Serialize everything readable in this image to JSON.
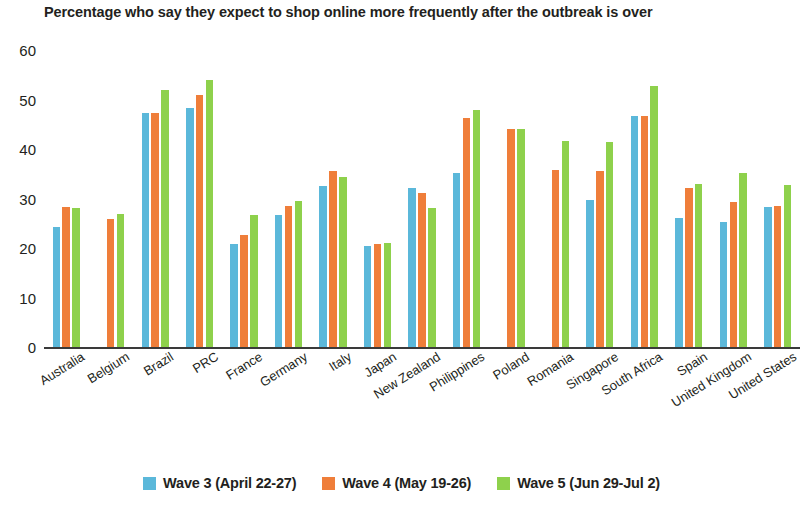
{
  "chart_data": {
    "type": "bar",
    "title": "Percentage who say they expect to shop online more frequently after the outbreak is over",
    "xlabel": "",
    "ylabel": "",
    "ylim": [
      0,
      60
    ],
    "yticks": [
      0,
      10,
      20,
      30,
      40,
      50,
      60
    ],
    "grid": false,
    "legend_position": "bottom",
    "categories": [
      "Australia",
      "Belgium",
      "Brazil",
      "PRC",
      "France",
      "Germany",
      "Italy",
      "Japan",
      "New Zealand",
      "Philippines",
      "Poland",
      "Romania",
      "Singapore",
      "South Africa",
      "Spain",
      "United Kingdom",
      "United States"
    ],
    "series": [
      {
        "name": "Wave 3 (April 22-27)",
        "color": "#5bb8da",
        "values": [
          24.3,
          null,
          47.2,
          48.2,
          20.8,
          26.6,
          32.5,
          20.4,
          32.2,
          35.1,
          null,
          null,
          29.6,
          46.7,
          26.1,
          25.3,
          28.3
        ]
      },
      {
        "name": "Wave 4 (May 19-26)",
        "color": "#ef7e3a",
        "values": [
          28.2,
          25.9,
          47.2,
          50.9,
          22.6,
          28.5,
          35.6,
          20.9,
          31.1,
          46.2,
          44.0,
          35.8,
          35.6,
          46.7,
          32.2,
          29.2,
          28.4
        ]
      },
      {
        "name": "Wave 5 (Jun 29-Jul 2)",
        "color": "#8ed14c",
        "values": [
          28.1,
          26.9,
          52.0,
          54.0,
          26.6,
          29.4,
          34.3,
          21.1,
          28.0,
          47.9,
          44.0,
          41.7,
          41.4,
          52.8,
          33.0,
          35.1,
          32.8
        ]
      }
    ]
  },
  "legend": {
    "items": [
      {
        "label": "Wave 3 (April 22-27)",
        "color": "#5bb8da"
      },
      {
        "label": "Wave 4 (May 19-26)",
        "color": "#ef7e3a"
      },
      {
        "label": "Wave 5 (Jun 29-Jul 2)",
        "color": "#8ed14c"
      }
    ]
  }
}
